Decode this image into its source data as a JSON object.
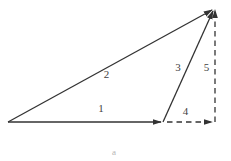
{
  "diagram": {
    "background_color": "#ffffff",
    "line_color": "#333333",
    "label_color": "#3f3f3f",
    "dash_pattern": "5.5 4",
    "vectors": [
      {
        "label": "1",
        "style": "solid",
        "from": [
          8,
          122
        ],
        "to": [
          161,
          122
        ],
        "label_x": 101,
        "label_y": 112
      },
      {
        "label": "2",
        "style": "solid",
        "from": [
          8,
          122
        ],
        "to": [
          212,
          10
        ],
        "label_x": 106.5,
        "label_y": 78
      },
      {
        "label": "3",
        "style": "solid",
        "from": [
          163,
          122
        ],
        "to": [
          213,
          11
        ],
        "label_x": 178,
        "label_y": 71
      },
      {
        "label": "4",
        "style": "dashed",
        "from": [
          167,
          122
        ],
        "to": [
          212,
          122
        ],
        "label_x": 185.5,
        "label_y": 115
      },
      {
        "label": "5",
        "style": "dashed",
        "from": [
          215,
          122
        ],
        "to": [
          215,
          10
        ],
        "label_x": 206.5,
        "label_y": 71
      }
    ],
    "caption": "a"
  }
}
